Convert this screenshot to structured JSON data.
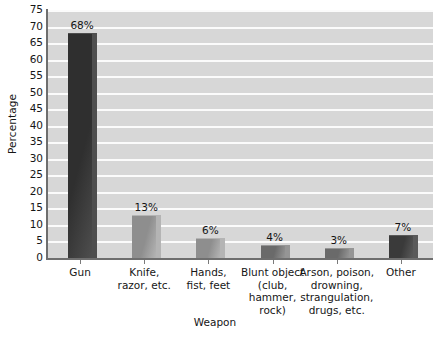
{
  "chart_data": {
    "type": "bar",
    "title": "",
    "xlabel": "Weapon",
    "ylabel": "Percentage",
    "categories": [
      "Gun",
      "Knife, razor, etc.",
      "Hands, fist, feet",
      "Blunt object (club, hammer, rock)",
      "Arson, poison, drowning, strangulation, drugs, etc.",
      "Other"
    ],
    "category_lines": [
      [
        "Gun"
      ],
      [
        "Knife,",
        "razor, etc."
      ],
      [
        "Hands,",
        "fist, feet"
      ],
      [
        "Blunt object",
        "(club,",
        "hammer,",
        "rock)"
      ],
      [
        "Arson, poison,",
        "drowning,",
        "strangulation,",
        "drugs, etc."
      ],
      [
        "Other"
      ]
    ],
    "values": [
      68,
      13,
      6,
      4,
      3,
      7
    ],
    "data_labels": [
      "68%",
      "13%",
      "6%",
      "4%",
      "3%",
      "7%"
    ],
    "ylim": [
      0,
      75
    ],
    "ytick_step": 5,
    "yticks": [
      75,
      70,
      65,
      60,
      55,
      50,
      45,
      40,
      35,
      30,
      25,
      20,
      15,
      10,
      5,
      0
    ],
    "grid": "horizontal",
    "legend": "none",
    "bar_colors": [
      "#2f2f2f",
      "#8e8e8e",
      "#8e8e8e",
      "#6a6a6a",
      "#6a6a6a",
      "#3a3a3a"
    ],
    "bar_side_colors": [
      "#4e4e4e",
      "#b4b4b4",
      "#b4b4b4",
      "#959595",
      "#959595",
      "#5a5a5a"
    ],
    "plot_background": "#d7d7d7",
    "gridline_color": "#fbfbfb",
    "axis_color": "#6e6e6e",
    "page_background": "#ffffff"
  }
}
